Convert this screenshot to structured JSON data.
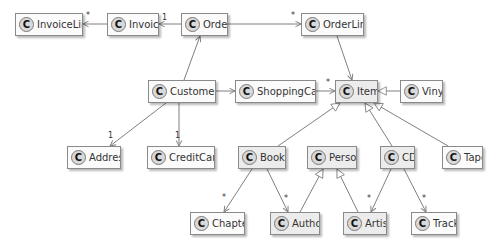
{
  "diagram": {
    "type": "uml-class-diagram",
    "stereotype_glyph": "C",
    "colors": {
      "box_fill": "#fbfbfb",
      "box_fill_shaded": "#ececec",
      "border": "#8a8a8a",
      "edge": "#7f7f7f",
      "text": "#333333"
    },
    "classes": [
      {
        "id": "InvoiceLine",
        "label": "InvoiceLine",
        "x": 15,
        "y": 13,
        "w": 68,
        "shaded": false
      },
      {
        "id": "Invoice",
        "label": "Invoice",
        "x": 107,
        "y": 13,
        "w": 52,
        "shaded": false
      },
      {
        "id": "Order",
        "label": "Order",
        "x": 181,
        "y": 13,
        "w": 47,
        "shaded": false
      },
      {
        "id": "OrderLine",
        "label": "OrderLine",
        "x": 301,
        "y": 13,
        "w": 63,
        "shaded": false
      },
      {
        "id": "Customer",
        "label": "Customer",
        "x": 148,
        "y": 80,
        "w": 68,
        "shaded": false
      },
      {
        "id": "ShoppingCart",
        "label": "ShoppingCart",
        "x": 235,
        "y": 80,
        "w": 81,
        "shaded": false
      },
      {
        "id": "Item",
        "label": "Item",
        "x": 335,
        "y": 80,
        "w": 43,
        "shaded": true
      },
      {
        "id": "Vinyl",
        "label": "Vinyl",
        "x": 400,
        "y": 80,
        "w": 43,
        "shaded": false
      },
      {
        "id": "Address",
        "label": "Address",
        "x": 67,
        "y": 146,
        "w": 54,
        "shaded": false
      },
      {
        "id": "CreditCard",
        "label": "CreditCard",
        "x": 147,
        "y": 146,
        "w": 68,
        "shaded": false
      },
      {
        "id": "Book",
        "label": "Book",
        "x": 238,
        "y": 146,
        "w": 48,
        "shaded": true
      },
      {
        "id": "Person",
        "label": "Person",
        "x": 307,
        "y": 146,
        "w": 50,
        "shaded": true
      },
      {
        "id": "CD",
        "label": "CD",
        "x": 380,
        "y": 146,
        "w": 35,
        "shaded": true
      },
      {
        "id": "Tape",
        "label": "Tape",
        "x": 442,
        "y": 146,
        "w": 41,
        "shaded": false
      },
      {
        "id": "Chapter",
        "label": "Chapter",
        "x": 190,
        "y": 212,
        "w": 55,
        "shaded": false
      },
      {
        "id": "Author",
        "label": "Author",
        "x": 270,
        "y": 212,
        "w": 50,
        "shaded": true
      },
      {
        "id": "Artist",
        "label": "Artist",
        "x": 343,
        "y": 212,
        "w": 44,
        "shaded": true
      },
      {
        "id": "Track",
        "label": "Track",
        "x": 411,
        "y": 212,
        "w": 46,
        "shaded": false
      }
    ],
    "edges": [
      {
        "from": "Invoice",
        "to": "InvoiceLine",
        "kind": "association",
        "multiplicity": "*",
        "x1": 107,
        "y1": 24,
        "x2": 83,
        "y2": 24,
        "lx": 86,
        "ly": 18
      },
      {
        "from": "Order",
        "to": "Invoice",
        "kind": "association",
        "multiplicity": "1",
        "x1": 181,
        "y1": 24,
        "x2": 159,
        "y2": 24,
        "lx": 162,
        "ly": 20
      },
      {
        "from": "Order",
        "to": "OrderLine",
        "kind": "association",
        "multiplicity": "*",
        "x1": 228,
        "y1": 24,
        "x2": 301,
        "y2": 24,
        "lx": 291,
        "ly": 18
      },
      {
        "from": "Customer",
        "to": "Order",
        "kind": "association",
        "multiplicity": "",
        "x1": 184,
        "y1": 80,
        "x2": 200,
        "y2": 36,
        "lx": 0,
        "ly": 0
      },
      {
        "from": "OrderLine",
        "to": "Item",
        "kind": "association",
        "multiplicity": "",
        "x1": 337,
        "y1": 36,
        "x2": 352,
        "y2": 80,
        "lx": 0,
        "ly": 0
      },
      {
        "from": "Customer",
        "to": "ShoppingCart",
        "kind": "association",
        "multiplicity": "",
        "x1": 216,
        "y1": 91,
        "x2": 235,
        "y2": 91,
        "lx": 0,
        "ly": 0
      },
      {
        "from": "ShoppingCart",
        "to": "Item",
        "kind": "association",
        "multiplicity": "*",
        "x1": 316,
        "y1": 91,
        "x2": 335,
        "y2": 91,
        "lx": 326,
        "ly": 85
      },
      {
        "from": "Customer",
        "to": "Address",
        "kind": "association",
        "multiplicity": "1",
        "x1": 166,
        "y1": 103,
        "x2": 110,
        "y2": 146,
        "lx": 108,
        "ly": 138
      },
      {
        "from": "Customer",
        "to": "CreditCard",
        "kind": "association",
        "multiplicity": "1",
        "x1": 179,
        "y1": 103,
        "x2": 179,
        "y2": 146,
        "lx": 175,
        "ly": 138
      },
      {
        "from": "Book",
        "to": "Chapter",
        "kind": "association",
        "multiplicity": "*",
        "x1": 252,
        "y1": 169,
        "x2": 224,
        "y2": 212,
        "lx": 222,
        "ly": 200
      },
      {
        "from": "Book",
        "to": "Author",
        "kind": "association",
        "multiplicity": "*",
        "x1": 267,
        "y1": 169,
        "x2": 288,
        "y2": 212,
        "lx": 284,
        "ly": 201
      },
      {
        "from": "CD",
        "to": "Artist",
        "kind": "association",
        "multiplicity": "*",
        "x1": 391,
        "y1": 169,
        "x2": 371,
        "y2": 212,
        "lx": 367,
        "ly": 201
      },
      {
        "from": "CD",
        "to": "Track",
        "kind": "association",
        "multiplicity": "*",
        "x1": 404,
        "y1": 169,
        "x2": 426,
        "y2": 212,
        "lx": 422,
        "ly": 201
      },
      {
        "from": "Vinyl",
        "to": "Item",
        "kind": "generalization",
        "multiplicity": "",
        "x1": 400,
        "y1": 91,
        "x2": 378,
        "y2": 91,
        "lx": 0,
        "ly": 0
      },
      {
        "from": "Book",
        "to": "Item",
        "kind": "generalization",
        "multiplicity": "",
        "x1": 278,
        "y1": 146,
        "x2": 340,
        "y2": 103,
        "lx": 0,
        "ly": 0
      },
      {
        "from": "CD",
        "to": "Item",
        "kind": "generalization",
        "multiplicity": "",
        "x1": 392,
        "y1": 146,
        "x2": 365,
        "y2": 103,
        "lx": 0,
        "ly": 0
      },
      {
        "from": "Tape",
        "to": "Item",
        "kind": "generalization",
        "multiplicity": "",
        "x1": 448,
        "y1": 146,
        "x2": 374,
        "y2": 103,
        "lx": 0,
        "ly": 0
      },
      {
        "from": "Author",
        "to": "Person",
        "kind": "generalization",
        "multiplicity": "",
        "x1": 300,
        "y1": 212,
        "x2": 323,
        "y2": 169,
        "lx": 0,
        "ly": 0
      },
      {
        "from": "Artist",
        "to": "Person",
        "kind": "generalization",
        "multiplicity": "",
        "x1": 358,
        "y1": 212,
        "x2": 337,
        "y2": 169,
        "lx": 0,
        "ly": 0
      }
    ]
  }
}
